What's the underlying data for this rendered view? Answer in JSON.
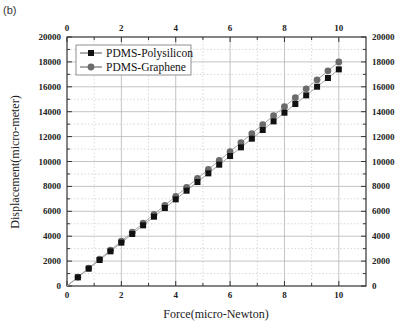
{
  "panel_label": "(b)",
  "chart_data": {
    "type": "line",
    "title": "",
    "xlabel": "Force(micro-Newton)",
    "ylabel": "Displacement(micro-meter)",
    "xlim": [
      0,
      11
    ],
    "ylim": [
      0,
      20000
    ],
    "x_ticks": [
      0,
      2,
      4,
      6,
      8,
      10
    ],
    "y_ticks": [
      0,
      2000,
      4000,
      6000,
      8000,
      10000,
      12000,
      14000,
      16000,
      18000,
      20000
    ],
    "grid": true,
    "legend_position": "upper left",
    "x": [
      0,
      0.4,
      0.8,
      1.2,
      1.6,
      2.0,
      2.4,
      2.8,
      3.2,
      3.6,
      4.0,
      4.4,
      4.8,
      5.2,
      5.6,
      6.0,
      6.4,
      6.8,
      7.2,
      7.6,
      8.0,
      8.4,
      8.8,
      9.2,
      9.6,
      10.0
    ],
    "series": [
      {
        "name": "PDMS-Polysilicon",
        "marker": "square",
        "color": "#111111",
        "values": [
          0,
          696,
          1392,
          2088,
          2784,
          3480,
          4176,
          4872,
          5568,
          6264,
          6960,
          7656,
          8352,
          9048,
          9744,
          10440,
          11136,
          11832,
          12528,
          13224,
          13920,
          14616,
          15312,
          16008,
          16704,
          17400
        ]
      },
      {
        "name": "PDMS-Graphene",
        "marker": "circle",
        "color": "#6b6b6b",
        "values": [
          0,
          720,
          1440,
          2160,
          2880,
          3600,
          4320,
          5040,
          5760,
          6480,
          7200,
          7920,
          8640,
          9360,
          10080,
          10800,
          11520,
          12240,
          12960,
          13680,
          14400,
          15120,
          15840,
          16560,
          17280,
          18000
        ]
      }
    ]
  }
}
